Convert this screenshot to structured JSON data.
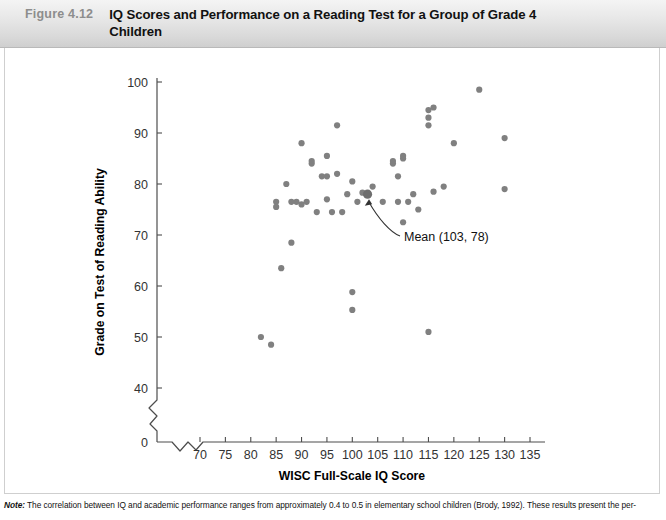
{
  "header": {
    "figure_number": "Figure 4.12",
    "title": "IQ Scores and Performance on a Reading Test for a Group of Grade 4 Children"
  },
  "note": {
    "label": "Note:",
    "text": " The correlation between IQ and academic performance ranges from approximately 0.4 to 0.5 in elementary school children (Brody, 1992). These results present the per-"
  },
  "colors": {
    "point": "#808080",
    "mean_point": "#6e6e6e",
    "axis": "#4d4d4d",
    "header_text": "#8d8d8d",
    "title_text": "#111111"
  },
  "annotation": {
    "label": "Mean (103, 78)",
    "x": 103,
    "y": 78
  },
  "chart_data": {
    "type": "scatter",
    "title": "IQ Scores and Performance on a Reading Test for a Group of Grade 4 Children",
    "xlabel": "WISC Full-Scale IQ Score",
    "ylabel": "Grade on Test of Reading Ability",
    "xlim": [
      67,
      138
    ],
    "ylim": [
      36,
      103
    ],
    "x_ticks": [
      70,
      75,
      80,
      85,
      90,
      95,
      100,
      105,
      110,
      115,
      120,
      125,
      130,
      135
    ],
    "y_ticks": [
      40,
      50,
      60,
      70,
      80,
      90,
      100
    ],
    "x_origin_label": "0",
    "y_origin_label": "0",
    "axis_break_x": true,
    "axis_break_y": true,
    "grid": false,
    "legend": false,
    "points": [
      [
        82,
        50.0
      ],
      [
        84,
        48.5
      ],
      [
        85,
        76.5
      ],
      [
        85,
        75.5
      ],
      [
        86,
        63.5
      ],
      [
        87,
        80.0
      ],
      [
        88,
        68.5
      ],
      [
        88,
        76.5
      ],
      [
        89,
        76.5
      ],
      [
        90,
        76.0
      ],
      [
        90,
        88.0
      ],
      [
        91,
        76.5
      ],
      [
        92,
        84.0
      ],
      [
        92,
        84.5
      ],
      [
        93,
        74.5
      ],
      [
        94,
        81.5
      ],
      [
        95,
        81.5
      ],
      [
        95,
        85.5
      ],
      [
        95,
        77.0
      ],
      [
        96,
        74.5
      ],
      [
        97,
        82.0
      ],
      [
        97,
        91.5
      ],
      [
        98,
        74.5
      ],
      [
        99,
        78.0
      ],
      [
        100,
        80.5
      ],
      [
        100,
        58.8
      ],
      [
        100,
        55.3
      ],
      [
        101,
        76.5
      ],
      [
        102,
        78.3
      ],
      [
        103,
        78.0
      ],
      [
        104,
        79.5
      ],
      [
        106,
        76.5
      ],
      [
        108,
        84.5
      ],
      [
        108,
        84.0
      ],
      [
        109,
        76.5
      ],
      [
        109,
        81.5
      ],
      [
        110,
        85.5
      ],
      [
        110,
        85.0
      ],
      [
        110,
        72.5
      ],
      [
        111,
        76.5
      ],
      [
        112,
        78.0
      ],
      [
        113,
        75.0
      ],
      [
        115,
        51.0
      ],
      [
        115,
        94.5
      ],
      [
        115,
        93.0
      ],
      [
        115,
        91.5
      ],
      [
        116,
        95.0
      ],
      [
        116,
        78.5
      ],
      [
        118,
        79.5
      ],
      [
        120,
        88.0
      ],
      [
        125,
        98.5
      ],
      [
        130,
        89.0
      ],
      [
        130,
        79.0
      ]
    ],
    "mean_point": [
      103,
      78
    ]
  }
}
